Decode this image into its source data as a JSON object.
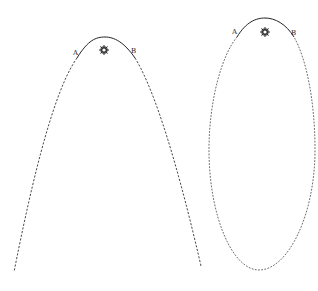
{
  "diagram": {
    "type": "orbit-comparison",
    "background": "#ffffff",
    "stroke_color": "#333333",
    "orbits": [
      {
        "name": "parabolic-orbit",
        "shape": "parabola",
        "apex": [
          105,
          37
        ],
        "ends": [
          [
            14,
            272
          ],
          [
            201,
            266
          ]
        ],
        "solid_segment_between": [
          "A",
          "B"
        ],
        "labels": {
          "a": {
            "text": "A",
            "pos": [
              73,
              55
            ]
          },
          "b": {
            "text": "B",
            "pos": [
              131,
              53
            ]
          }
        },
        "sun": {
          "pos": [
            104,
            50
          ],
          "icon": "sun-icon"
        }
      },
      {
        "name": "elliptical-orbit",
        "shape": "ellipse",
        "top": [
          265,
          18
        ],
        "bottom": [
          259,
          270
        ],
        "left_x": 209,
        "right_x": 315,
        "solid_segment_between": [
          "A",
          "B"
        ],
        "labels": {
          "a": {
            "text": "A",
            "pos": [
              232,
              34
            ]
          },
          "b": {
            "text": "B",
            "pos": [
              291,
              35
            ]
          }
        },
        "sun": {
          "pos": [
            265,
            32
          ],
          "icon": "sun-icon"
        }
      }
    ]
  }
}
